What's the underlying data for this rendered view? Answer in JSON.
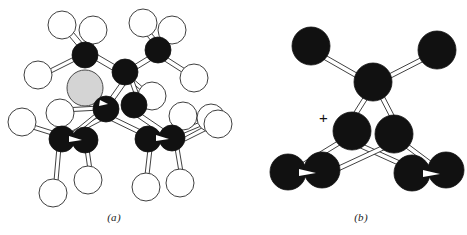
{
  "figure": {
    "background_color": "#ffffff",
    "panels": [
      {
        "id": "a",
        "caption": "(a)",
        "description": "Ball-and-stick cluster with dark (filled) atoms, open (white) atoms and one shaded grey atom",
        "colors": {
          "dark_atom": "#111111",
          "open_atom_fill": "#ffffff",
          "open_atom_stroke": "#3a3a3a",
          "grey_atom_fill": "#d4d4d4",
          "grey_atom_stroke": "#4a4a4a",
          "bond_fill": "#ffffff",
          "bond_stroke": "#2b2b2b"
        },
        "counts": {
          "dark_atoms": 9,
          "open_atoms": 16,
          "grey_atoms": 1
        }
      },
      {
        "id": "b",
        "caption": "(b)",
        "charge_label": "+",
        "description": "Ball-and-stick cation cluster with all dark (filled) atoms",
        "colors": {
          "dark_atom": "#111111",
          "bond_fill": "#ffffff",
          "bond_stroke": "#2b2b2b"
        },
        "counts": {
          "dark_atoms": 9
        }
      }
    ]
  }
}
